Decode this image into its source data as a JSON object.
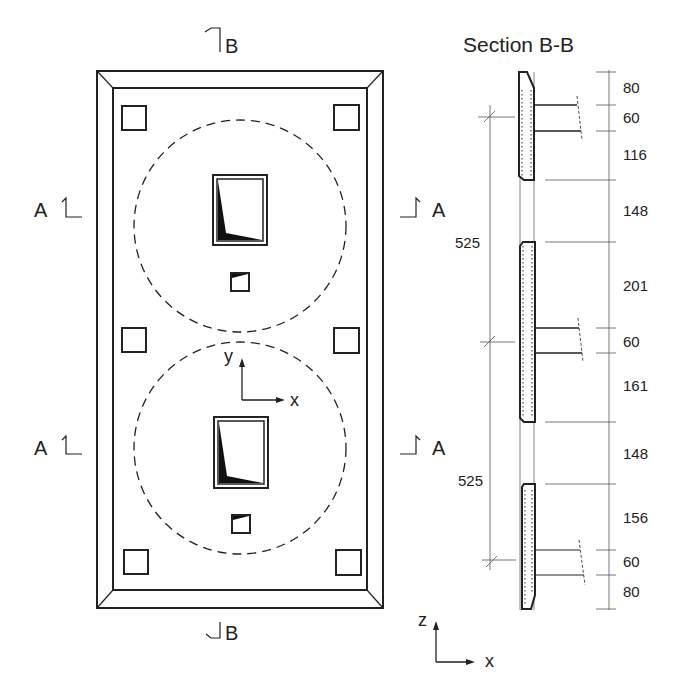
{
  "plan": {
    "section_b_marker_top": "B",
    "section_b_marker_bottom": "B",
    "section_a_markers": [
      "A",
      "A",
      "A",
      "A"
    ],
    "axis_labels": {
      "y": "y",
      "x": "x"
    }
  },
  "section": {
    "title": "Section B-B",
    "dimensions_right": [
      "80",
      "60",
      "116",
      "148",
      "201",
      "60",
      "161",
      "148",
      "156",
      "60",
      "80"
    ],
    "dimensions_left": [
      "525",
      "525"
    ],
    "axis_labels": {
      "z": "z",
      "x": "x"
    }
  },
  "colors": {
    "line": "#222222",
    "fill": "#111111",
    "light": "#666666"
  }
}
